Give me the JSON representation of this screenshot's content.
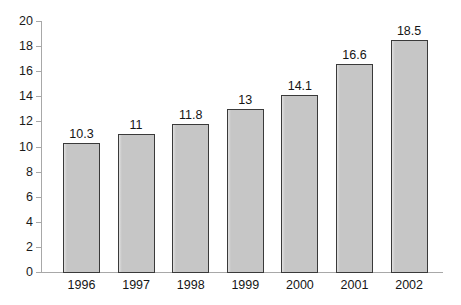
{
  "chart_data": {
    "type": "bar",
    "title": "",
    "subtitle": "",
    "xlabel": "",
    "ylabel": "",
    "categories": [
      "1996",
      "1997",
      "1998",
      "1999",
      "2000",
      "2001",
      "2002"
    ],
    "values": [
      10.3,
      11,
      11.8,
      13,
      14.1,
      16.6,
      18.5
    ],
    "data_labels": [
      "10.3",
      "11",
      "11.8",
      "13",
      "14.1",
      "16.6",
      "18.5"
    ],
    "ylim": [
      0,
      20
    ],
    "y_ticks": [
      0,
      2,
      4,
      6,
      8,
      10,
      12,
      14,
      16,
      18,
      20
    ],
    "y_tick_labels": [
      "0",
      "2",
      "4",
      "6",
      "8",
      "10",
      "12",
      "14",
      "16",
      "18",
      "20"
    ],
    "grid": false,
    "legend": null,
    "legend_position": "none",
    "series": [
      {
        "name": "",
        "values": [
          10.3,
          11,
          11.8,
          13,
          14.1,
          16.6,
          18.5
        ]
      }
    ],
    "colors": {
      "bar_fill": "#c6c6c6",
      "bar_border": "#3a3a3a",
      "axis": "#a8a8a8",
      "text": "#151515",
      "background": "#ffffff"
    }
  }
}
